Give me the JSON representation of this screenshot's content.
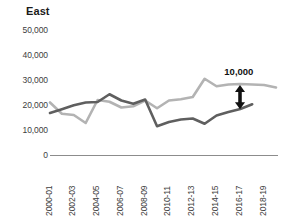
{
  "chart_data": {
    "type": "line",
    "title": "East",
    "xlabel": "",
    "ylabel": "",
    "ylim": [
      0,
      50000
    ],
    "ytick_values": [
      50000,
      40000,
      30000,
      20000,
      10000,
      0
    ],
    "ytick_labels": [
      "50,000",
      "40,000",
      "30,000",
      "20,000",
      "10,000",
      "0"
    ],
    "grid": false,
    "legend": "none",
    "x": [
      "2000-01",
      "2001-02",
      "2002-03",
      "2003-04",
      "2004-05",
      "2005-06",
      "2006-07",
      "2007-08",
      "2008-09",
      "2009-10",
      "2010-11",
      "2011-12",
      "2012-13",
      "2013-14",
      "2014-15",
      "2015-16",
      "2016-17",
      "2017-18",
      "2018-19",
      "2019-20"
    ],
    "xtick_labels": [
      "2000-01",
      "2002-03",
      "2004-05",
      "2006-07",
      "2008-09",
      "2010-11",
      "2012-13",
      "2014-15",
      "2016-17",
      "2018-19"
    ],
    "xtick_indices": [
      0,
      2,
      4,
      6,
      8,
      10,
      12,
      14,
      16,
      18
    ],
    "series": [
      {
        "name": "light-series",
        "color": "#b3b3b3",
        "values": [
          21000,
          16500,
          16000,
          12800,
          22000,
          21300,
          19000,
          19500,
          21800,
          18700,
          21800,
          22300,
          23200,
          30500,
          27500,
          28200,
          28400,
          28200,
          28000,
          27000
        ]
      },
      {
        "name": "dark-series",
        "color": "#5f5f5f",
        "values": [
          16800,
          18300,
          19900,
          21000,
          21200,
          24300,
          21800,
          20500,
          22200,
          11500,
          13200,
          14200,
          14600,
          12500,
          15800,
          17200,
          18400,
          20300,
          null,
          null
        ]
      }
    ],
    "annotations": [
      {
        "name": "gap-annotation",
        "label": "10,000",
        "value": 10000,
        "at_x": "2016-17",
        "arrow": "double-headed-vertical",
        "from_value": 18500,
        "to_value": 28200
      }
    ]
  },
  "colors": {
    "light_series": "#b3b3b3",
    "dark_series": "#5f5f5f",
    "axis": "#8c8c8c",
    "text": "#3d3d3d",
    "title": "#1a1a1a",
    "annotation": "#111111",
    "background": "#ffffff"
  }
}
